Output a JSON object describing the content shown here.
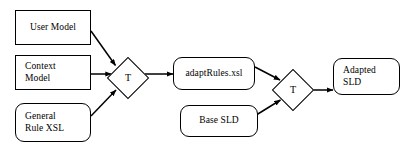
{
  "diagram": {
    "background_color": "#ffffff",
    "stroke_color": "#000000",
    "text_color": "#000000",
    "nodes": [
      {
        "id": "user-model",
        "label": "User Model",
        "shape": "rectangle",
        "x": 15,
        "y": 10,
        "w": 76,
        "h": 35,
        "align": "center"
      },
      {
        "id": "context-model",
        "label": "Context\nModel",
        "shape": "rectangle",
        "x": 15,
        "y": 55,
        "w": 76,
        "h": 35,
        "align": "left"
      },
      {
        "id": "general-rule-xsl",
        "label": "General\nRule XSL",
        "shape": "rounded-rectangle",
        "x": 15,
        "y": 103,
        "w": 76,
        "h": 39,
        "align": "left"
      },
      {
        "id": "transform-1",
        "label": "T",
        "shape": "diamond",
        "cx": 128,
        "cy": 78
      },
      {
        "id": "adapt-rules-xsl",
        "label": "adaptRules.xsl",
        "shape": "rounded-rectangle",
        "x": 173,
        "y": 57,
        "w": 82,
        "h": 33,
        "align": "center"
      },
      {
        "id": "base-sld",
        "label": "Base SLD",
        "shape": "rounded-rectangle",
        "x": 180,
        "y": 105,
        "w": 78,
        "h": 32,
        "align": "center"
      },
      {
        "id": "transform-2",
        "label": "T",
        "shape": "diamond",
        "cx": 293,
        "cy": 90
      },
      {
        "id": "adapted-sld",
        "label": "Adapted\nSLD",
        "shape": "rounded-rectangle",
        "x": 333,
        "y": 58,
        "w": 67,
        "h": 37,
        "align": "left"
      }
    ],
    "edges": [
      {
        "id": "edge-user-model-to-transform-1",
        "from": "user-model",
        "to": "transform-1",
        "kind": "diagonal-down"
      },
      {
        "id": "edge-context-model-to-transform-1",
        "from": "context-model",
        "to": "transform-1",
        "kind": "horizontal"
      },
      {
        "id": "edge-general-rule-xsl-to-transform-1",
        "from": "general-rule-xsl",
        "to": "transform-1",
        "kind": "diagonal-up"
      },
      {
        "id": "edge-transform-1-to-adapt-rules",
        "from": "transform-1",
        "to": "adapt-rules-xsl",
        "kind": "horizontal"
      },
      {
        "id": "edge-adapt-rules-to-transform-2",
        "from": "adapt-rules-xsl",
        "to": "transform-2",
        "kind": "diagonal-down"
      },
      {
        "id": "edge-base-sld-to-transform-2",
        "from": "base-sld",
        "to": "transform-2",
        "kind": "diagonal-up"
      },
      {
        "id": "edge-transform-2-to-adapted-sld",
        "from": "transform-2",
        "to": "adapted-sld",
        "kind": "horizontal"
      }
    ]
  }
}
